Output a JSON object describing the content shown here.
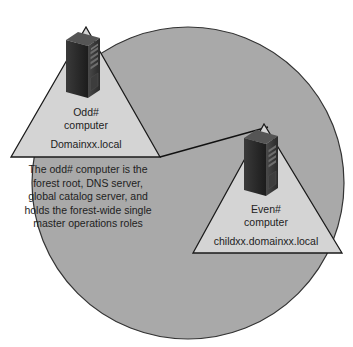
{
  "diagram": {
    "type": "forest-domain-topology",
    "colors": {
      "background": "#ffffff",
      "forest_circle_fill": "#a9a9a9",
      "forest_circle_stroke": "#333333",
      "triangle_fill": "#d4d4d4",
      "triangle_stroke": "#1a1a1a",
      "connector": "#111111",
      "server_body": "#2b2b2b",
      "text": "#222222"
    },
    "forest": {
      "shape": "circle"
    },
    "domains": [
      {
        "id": "root-domain",
        "computer_label_line1": "Odd#",
        "computer_label_line2": "computer",
        "domain_name": "Domainxx.local",
        "icon": "server-tower-icon"
      },
      {
        "id": "child-domain",
        "computer_label_line1": "Even#",
        "computer_label_line2": "computer",
        "domain_name": "childxx.domainxx.local",
        "icon": "server-tower-icon"
      }
    ],
    "description": {
      "line1": "The odd# computer is the",
      "line2": "forest root, DNS server,",
      "line3": "global catalog server, and",
      "line4": "holds the forest-wide single",
      "line5": "master operations roles"
    }
  }
}
